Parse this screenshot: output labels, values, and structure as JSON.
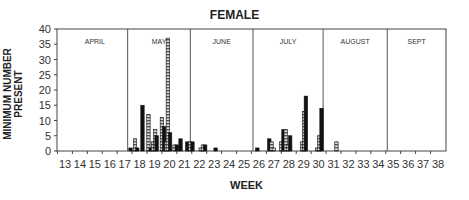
{
  "chart_data": {
    "type": "bar",
    "title": "FEMALE",
    "xlabel": "WEEK",
    "ylabel": "MINIMUM NUMBER PRESENT",
    "ylim": [
      0,
      40
    ],
    "yticks": [
      0,
      5,
      10,
      15,
      20,
      25,
      30,
      35,
      40
    ],
    "xticks": [
      13,
      14,
      15,
      16,
      17,
      18,
      19,
      20,
      21,
      22,
      23,
      24,
      25,
      26,
      27,
      28,
      29,
      30,
      31,
      32,
      33,
      34,
      35,
      36,
      37,
      38
    ],
    "grid": false,
    "months": [
      {
        "label": "APRIL",
        "start": 12.8,
        "end": 17.2
      },
      {
        "label": "MAY",
        "start": 17.2,
        "end": 21.4
      },
      {
        "label": "JUNE",
        "start": 21.4,
        "end": 25.6
      },
      {
        "label": "JULY",
        "start": 25.6,
        "end": 30.3
      },
      {
        "label": "AUGUST",
        "start": 30.3,
        "end": 34.6
      },
      {
        "label": "SEPT",
        "start": 34.6,
        "end": 38.6
      }
    ],
    "bars": [
      {
        "week": 17.4,
        "value": 1,
        "style": "solid"
      },
      {
        "week": 17.7,
        "value": 4,
        "style": "striped"
      },
      {
        "week": 17.85,
        "value": 1,
        "style": "solid"
      },
      {
        "week": 18.2,
        "value": 15,
        "style": "solid"
      },
      {
        "week": 18.6,
        "value": 12,
        "style": "striped"
      },
      {
        "week": 18.75,
        "value": 1,
        "style": "solid"
      },
      {
        "week": 18.9,
        "value": 3,
        "style": "striped"
      },
      {
        "week": 19.05,
        "value": 7,
        "style": "striped"
      },
      {
        "week": 19.15,
        "value": 5,
        "style": "solid"
      },
      {
        "week": 19.5,
        "value": 11,
        "style": "striped"
      },
      {
        "week": 19.65,
        "value": 8,
        "style": "solid"
      },
      {
        "week": 19.8,
        "value": 3,
        "style": "striped"
      },
      {
        "week": 19.9,
        "value": 37,
        "style": "striped"
      },
      {
        "week": 20.05,
        "value": 6,
        "style": "solid"
      },
      {
        "week": 20.35,
        "value": 2,
        "style": "striped"
      },
      {
        "week": 20.5,
        "value": 2,
        "style": "solid"
      },
      {
        "week": 20.75,
        "value": 4,
        "style": "solid"
      },
      {
        "week": 21.2,
        "value": 3,
        "style": "solid"
      },
      {
        "week": 21.4,
        "value": 3,
        "style": "striped"
      },
      {
        "week": 21.55,
        "value": 3,
        "style": "solid"
      },
      {
        "week": 22.1,
        "value": 1,
        "style": "striped"
      },
      {
        "week": 22.25,
        "value": 2,
        "style": "striped"
      },
      {
        "week": 22.4,
        "value": 2,
        "style": "solid"
      },
      {
        "week": 23.1,
        "value": 1,
        "style": "solid"
      },
      {
        "week": 25.9,
        "value": 1,
        "style": "solid"
      },
      {
        "week": 26.7,
        "value": 4,
        "style": "solid"
      },
      {
        "week": 26.85,
        "value": 3,
        "style": "striped"
      },
      {
        "week": 27.0,
        "value": 1,
        "style": "striped"
      },
      {
        "week": 27.5,
        "value": 3,
        "style": "striped"
      },
      {
        "week": 27.65,
        "value": 7,
        "style": "solid"
      },
      {
        "week": 27.8,
        "value": 7,
        "style": "striped"
      },
      {
        "week": 27.95,
        "value": 2,
        "style": "striped"
      },
      {
        "week": 28.1,
        "value": 5,
        "style": "solid"
      },
      {
        "week": 28.9,
        "value": 3,
        "style": "striped"
      },
      {
        "week": 29.05,
        "value": 13,
        "style": "striped"
      },
      {
        "week": 29.15,
        "value": 18,
        "style": "solid"
      },
      {
        "week": 29.9,
        "value": 1,
        "style": "striped"
      },
      {
        "week": 30.05,
        "value": 5,
        "style": "striped"
      },
      {
        "week": 30.2,
        "value": 14,
        "style": "solid"
      },
      {
        "week": 31.2,
        "value": 3,
        "style": "striped"
      }
    ]
  },
  "labels": {
    "title": "FEMALE",
    "xlabel": "WEEK",
    "ylabel": "MINIMUM NUMBER PRESENT"
  }
}
